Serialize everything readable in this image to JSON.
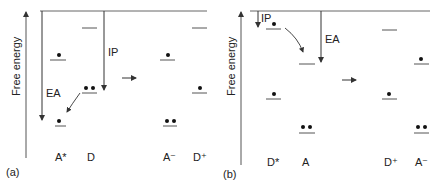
{
  "panel_a": {
    "tag": "(a)",
    "axis_label": "Free energy",
    "arrow_labels": {
      "ea": "EA",
      "ip": "IP"
    },
    "species": [
      {
        "label": "A*",
        "electrons_hi": 1,
        "electrons_lo": 1
      },
      {
        "label": "D",
        "electrons_hi": 0,
        "electrons_lo": 2
      },
      {
        "label": "A⁻",
        "electrons_hi": 1,
        "electrons_lo": 2
      },
      {
        "label": "D⁺",
        "electrons_hi": 0,
        "electrons_lo": 1
      }
    ]
  },
  "panel_b": {
    "tag": "(b)",
    "axis_label": "Free energy",
    "arrow_labels": {
      "ip": "IP",
      "ea": "EA"
    },
    "species": [
      {
        "label": "D*",
        "electrons_hi": 1,
        "electrons_lo": 1
      },
      {
        "label": "A",
        "electrons_hi": 0,
        "electrons_lo": 2
      },
      {
        "label": "D⁺",
        "electrons_hi": 0,
        "electrons_lo": 1
      },
      {
        "label": "A⁻",
        "electrons_hi": 1,
        "electrons_lo": 2
      }
    ]
  }
}
